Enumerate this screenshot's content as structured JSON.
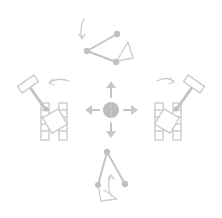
{
  "diagram": {
    "colors": {
      "line": "#c4c4c4",
      "center_dot": "#bdbdbd",
      "background": "#ffffff"
    },
    "center": {
      "icon": "move-four-direction-icon",
      "directions": [
        "up",
        "down",
        "left",
        "right"
      ]
    },
    "views": [
      {
        "position": "top",
        "icon": "linkage-arm-icon",
        "rotation_arrow": "counter-clockwise"
      },
      {
        "position": "left",
        "icon": "tracked-robot-arm-icon",
        "rotation_arrow": "counter-clockwise"
      },
      {
        "position": "right",
        "icon": "tracked-robot-arm-icon",
        "rotation_arrow": "clockwise"
      },
      {
        "position": "bottom",
        "icon": "linkage-arm-icon",
        "rotation_arrow": "up"
      }
    ]
  }
}
